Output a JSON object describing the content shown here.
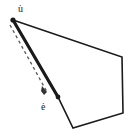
{
  "figure": {
    "background_color": "#ffffff",
    "stroke_color": "#1a1a1a",
    "dash_color": "#555555",
    "width": 136,
    "height": 139,
    "labels": {
      "u_label": "u̇",
      "e_label": "ė"
    },
    "polygon": {
      "name": "polygon-outline",
      "points": "13,20 122,57 123,113 73,128 58,97",
      "stroke_width": 1.6
    },
    "thick_edge": {
      "name": "edge-u-to-e",
      "x1": 13,
      "y1": 20,
      "x2": 58,
      "y2": 97,
      "stroke_width": 3.2
    },
    "dashed_vector": {
      "name": "dashed-vector-arrow",
      "x1": 10,
      "y1": 25,
      "x2": 47,
      "y2": 92,
      "stroke_width": 1.3,
      "dash_pattern": "3 3"
    },
    "markers": {
      "vertex_u": {
        "cx": 13,
        "cy": 20,
        "r": 2.6
      },
      "vertex_e": {
        "cx": 58,
        "cy": 97,
        "r": 2.4
      }
    },
    "arrowhead": {
      "name": "arrowhead-e",
      "points": "47,92 42,86 41,91 44,95"
    }
  }
}
